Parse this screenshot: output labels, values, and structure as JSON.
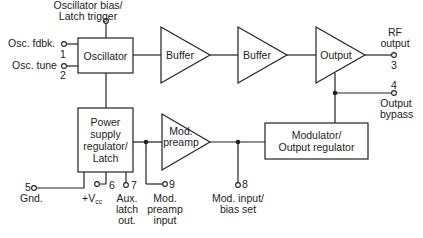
{
  "diagram": {
    "blocks": {
      "oscillator": "Oscillator",
      "buffer1": "Buffer",
      "buffer2": "Buffer",
      "output": "Output",
      "power_line1": "Power",
      "power_line2": "supply",
      "power_line3": "regulator/",
      "power_line4": "Latch",
      "preamp_line1": "Mod.",
      "preamp_line2": "preamp",
      "modulator_line1": "Modulator/",
      "modulator_line2": "Output regulator"
    },
    "pins": {
      "bias_line1": "Oscillator bias/",
      "bias_line2": "Latch trigger",
      "p1_label": "Osc. fdbk.",
      "p1_num": "1",
      "p2_label": "Osc. tune",
      "p2_num": "2",
      "rf_line1": "RF",
      "rf_line2": "output",
      "p3_num": "3",
      "p4_num": "4",
      "bypass_line1": "Output",
      "bypass_line2": "bypass",
      "p5_num": "5",
      "p5_label": "Gnd.",
      "p6_num": "6",
      "p6_label": "+V",
      "p6_sub": "cc",
      "p7_num": "7",
      "p7_line1": "Aux.",
      "p7_line2": "latch",
      "p7_line3": "out.",
      "p9_num": "9",
      "p9_line1": "Mod.",
      "p9_line2": "preamp",
      "p9_line3": "input",
      "p8_num": "8",
      "p8_line1": "Mod. input/",
      "p8_line2": "bias set"
    }
  }
}
